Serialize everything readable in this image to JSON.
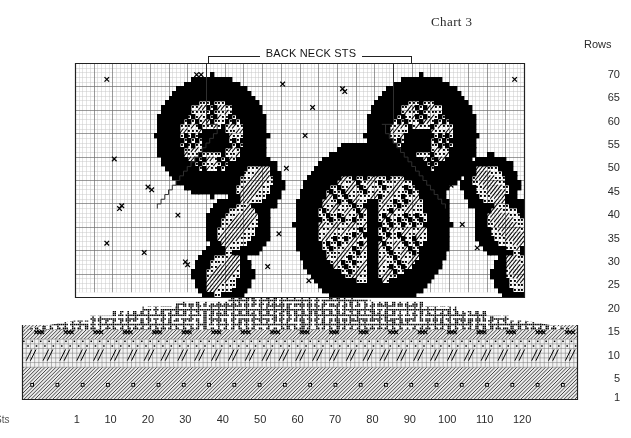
{
  "title": "Chart 3",
  "axes": {
    "rows_heading": "Rows",
    "sts_corner_label": "Sts",
    "row_labels": [
      "70",
      "65",
      "60",
      "55",
      "50",
      "45",
      "40",
      "35",
      "30",
      "25",
      "20",
      "15",
      "10",
      "5",
      "1"
    ],
    "row_values": [
      70,
      65,
      60,
      55,
      50,
      45,
      40,
      35,
      30,
      25,
      20,
      15,
      10,
      5,
      1
    ],
    "col_labels": [
      "1",
      "10",
      "20",
      "30",
      "40",
      "50",
      "60",
      "70",
      "80",
      "90",
      "100",
      "110",
      "120"
    ],
    "col_values": [
      1,
      10,
      20,
      30,
      40,
      50,
      60,
      70,
      80,
      90,
      100,
      110,
      120
    ]
  },
  "annotation": {
    "back_neck_label": "BACK NECK STS"
  },
  "colors": {
    "ink": "#000000",
    "paper": "#ffffff",
    "grid_minor": "#c8c8c8",
    "grid_major": "#6e6e6e",
    "border": "#222222",
    "text": "#2b2b2b"
  },
  "chart_data": {
    "type": "heatmap",
    "title": "Chart 3",
    "xlabel": "Sts",
    "ylabel": "Rows",
    "xlim": [
      1,
      120
    ],
    "ylim": [
      1,
      72
    ],
    "grid": true,
    "grid_major_every": 5,
    "legend_position": "none",
    "annotations": [
      {
        "text": "BACK NECK STS",
        "x_start": 36,
        "x_end": 85,
        "y": 72,
        "type": "bracket"
      }
    ],
    "cell_symbols": [
      {
        "key": "blank",
        "name": "plain-stitch",
        "render": "empty"
      },
      {
        "key": "solid",
        "name": "solid-dark-stitch",
        "render": "black-fill"
      },
      {
        "key": "dot",
        "name": "dotted-stitch",
        "render": "dot-pattern"
      },
      {
        "key": "hatch",
        "name": "diagonal-hatch-stitch",
        "render": "diagonal-lines"
      },
      {
        "key": "cross",
        "name": "cross-stitch-mark",
        "render": "x-glyph"
      },
      {
        "key": "wave",
        "name": "dense-wave-texture",
        "render": "dense-noise"
      },
      {
        "key": "slash",
        "name": "slash-and-dot-band",
        "render": "slash-dot"
      },
      {
        "key": "twill",
        "name": "fine-twill-band",
        "render": "fine-diagonal"
      }
    ],
    "bands": [
      {
        "name": "hem-twill-band",
        "row_start": 1,
        "row_end": 7,
        "symbol": "twill"
      },
      {
        "name": "slash-dot-band",
        "row_start": 8,
        "row_end": 13,
        "symbol": "slash"
      },
      {
        "name": "cross-row-band",
        "row_start": 14,
        "row_end": 16,
        "symbol": "cross"
      },
      {
        "name": "dense-wave-band",
        "row_start": 17,
        "row_end": 22,
        "symbol": "wave"
      },
      {
        "name": "motif-field",
        "row_start": 23,
        "row_end": 72,
        "symbol": "blank"
      }
    ],
    "motifs": [
      {
        "name": "shell-top-left",
        "cx": 37,
        "cy": 57,
        "rx": 15,
        "ry": 13,
        "kind": "scallop",
        "mirror": false
      },
      {
        "name": "shell-top-right",
        "cx": 93,
        "cy": 57,
        "rx": 15,
        "ry": 13,
        "kind": "scallop",
        "mirror": true
      },
      {
        "name": "shell-center",
        "cx": 80,
        "cy": 38,
        "rx": 21,
        "ry": 18,
        "kind": "big-fan",
        "mirror": false
      },
      {
        "name": "leaf-cluster-left",
        "cx": 44,
        "cy": 36,
        "rx": 14,
        "ry": 16,
        "kind": "leaves",
        "mirror": false
      },
      {
        "name": "leaf-cluster-right",
        "cx": 116,
        "cy": 36,
        "rx": 14,
        "ry": 16,
        "kind": "leaves",
        "mirror": true
      }
    ],
    "neck_shaping": {
      "name": "back-neck-staircase",
      "left_edge_col": 36,
      "right_edge_col": 85,
      "top_row": 72,
      "bottom_row": 50,
      "description": "stepped diagonal decrease from neck opening down to shoulders"
    },
    "scatter_marks": {
      "name": "seed-cross-marks",
      "symbol": "x",
      "count": 38,
      "description": "isolated and clustered X marks scattered across the open ground"
    }
  }
}
